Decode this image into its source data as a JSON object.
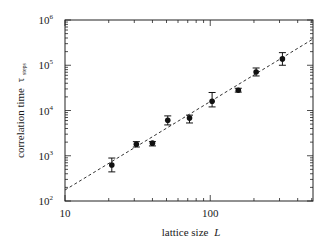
{
  "chart_data": {
    "type": "scatter",
    "title": "",
    "xlabel": "lattice size",
    "xlabel_var": "L",
    "ylabel": "correlation time",
    "ylabel_var": "τ",
    "ylabel_sub": "steps",
    "xscale": "log",
    "yscale": "log",
    "xlim": [
      10,
      510
    ],
    "ylim": [
      100,
      1000000
    ],
    "grid": false,
    "legend": "none",
    "x_ticks": [
      {
        "value": 10,
        "base": "10",
        "exp": ""
      },
      {
        "value": 100,
        "base": "100",
        "exp": ""
      }
    ],
    "y_ticks": [
      {
        "value": 100,
        "base": "10",
        "exp": "2"
      },
      {
        "value": 1000,
        "base": "10",
        "exp": "3"
      },
      {
        "value": 10000,
        "base": "10",
        "exp": "4"
      },
      {
        "value": 100000,
        "base": "10",
        "exp": "5"
      },
      {
        "value": 1000000,
        "base": "10",
        "exp": "6"
      }
    ],
    "series": [
      {
        "name": "measured",
        "marker": "filled-circle",
        "color": "#111111",
        "points": [
          {
            "x": 21,
            "y": 625,
            "ylo": 440,
            "yhi": 890
          },
          {
            "x": 31,
            "y": 1800,
            "ylo": 1560,
            "yhi": 2050
          },
          {
            "x": 40,
            "y": 1900,
            "ylo": 1650,
            "yhi": 2050
          },
          {
            "x": 51,
            "y": 6100,
            "ylo": 4800,
            "yhi": 7600
          },
          {
            "x": 72,
            "y": 6800,
            "ylo": 5300,
            "yhi": 7900
          },
          {
            "x": 103,
            "y": 16000,
            "ylo": 12000,
            "yhi": 25000
          },
          {
            "x": 156,
            "y": 28000,
            "ylo": 25500,
            "yhi": 31000
          },
          {
            "x": 207,
            "y": 71000,
            "ylo": 58000,
            "yhi": 87000
          },
          {
            "x": 314,
            "y": 138000,
            "ylo": 100000,
            "yhi": 190000
          }
        ]
      },
      {
        "name": "power-law fit",
        "style": "dashed",
        "color": "#333333",
        "x": [
          10,
          510
        ],
        "y": [
          175,
          380000
        ]
      }
    ]
  }
}
